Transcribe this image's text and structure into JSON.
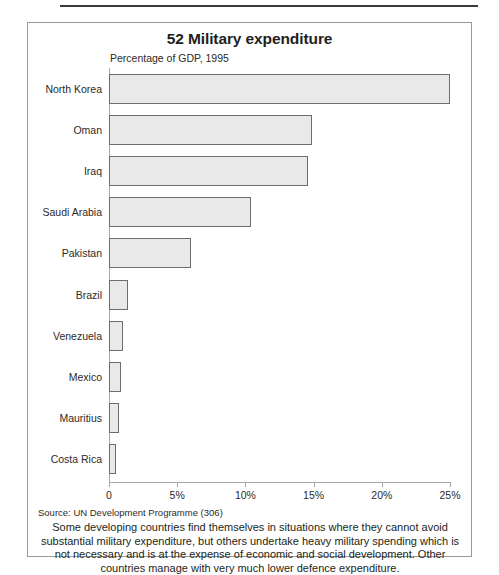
{
  "figure": {
    "title": "52 Military expenditure",
    "subtitle": "Percentage of GDP, 1995",
    "source": "Source: UN Development Programme (306)",
    "caption": "Some developing countries find themselves in situations where they cannot avoid substantial military expenditure, but others undertake heavy military spending which is not necessary and is at the expense of economic and social development. Other countries manage with very much lower defence expenditure."
  },
  "chart_data": {
    "type": "bar",
    "orientation": "horizontal",
    "title": "52 Military expenditure",
    "subtitle": "Percentage of GDP, 1995",
    "xlabel": "",
    "ylabel": "",
    "xlim": [
      0,
      25
    ],
    "grid": false,
    "legend": null,
    "tick_labels": [
      "0",
      "5%",
      "10%",
      "15%",
      "20%",
      "25%"
    ],
    "tick_values": [
      0,
      5,
      10,
      15,
      20,
      25
    ],
    "categories": [
      "North Korea",
      "Oman",
      "Iraq",
      "Saudi Arabia",
      "Pakistan",
      "Brazil",
      "Venezuela",
      "Mexico",
      "Mauritius",
      "Costa Rica"
    ],
    "values": [
      25.0,
      14.9,
      14.6,
      10.4,
      6.0,
      1.4,
      1.0,
      0.9,
      0.7,
      0.5
    ],
    "colors": {
      "bar_fill": "#e9e9e9",
      "bar_border": "#6d6d6d",
      "axis": "#a8a8a8",
      "text": "#2d2a28"
    }
  }
}
